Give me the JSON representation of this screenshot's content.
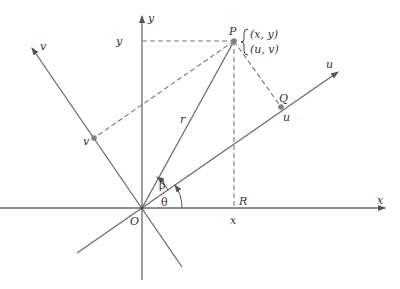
{
  "diagram": {
    "type": "coordinate-rotation",
    "colors": {
      "line": "#6b6b6b",
      "dashed": "#777777",
      "text": "#333333",
      "point": "#808080"
    },
    "labels": {
      "x_axis": "x",
      "y_axis": "y",
      "u_axis": "u",
      "v_axis": "v",
      "origin": "O",
      "point_P": "P",
      "point_Q": "Q",
      "point_R": "R",
      "y_tick": "y",
      "x_tick": "x",
      "u_tick": "u",
      "v_tick": "v",
      "radius": "r",
      "angle_theta": "θ",
      "angle_beta": "β",
      "coords_xy": "(x, y)",
      "coords_uv": "(u, v)"
    }
  }
}
